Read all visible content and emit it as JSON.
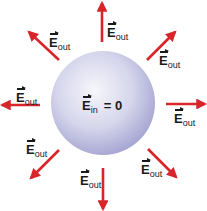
{
  "diagram": {
    "sphere": {
      "cx": 103,
      "cy": 103,
      "r": 52,
      "color_light": "#f4f4fa",
      "color_mid": "#c8c8e6",
      "color_dark": "#9f9fd0"
    },
    "center_label": {
      "symbol": "E",
      "subscript": "in",
      "equals": "= 0"
    },
    "arrow_color": "#d8252a",
    "arrows": [
      {
        "name": "top",
        "x1": 102,
        "y1": 42,
        "x2": 102,
        "y2": 3
      },
      {
        "name": "top-right",
        "x1": 147,
        "y1": 60,
        "x2": 175,
        "y2": 32
      },
      {
        "name": "right",
        "x1": 166,
        "y1": 104,
        "x2": 205,
        "y2": 104
      },
      {
        "name": "bottom-right",
        "x1": 148,
        "y1": 149,
        "x2": 176,
        "y2": 177
      },
      {
        "name": "bottom",
        "x1": 103,
        "y1": 168,
        "x2": 103,
        "y2": 209
      },
      {
        "name": "bottom-left",
        "x1": 59,
        "y1": 150,
        "x2": 31,
        "y2": 178
      },
      {
        "name": "left",
        "x1": 40,
        "y1": 105,
        "x2": 2,
        "y2": 105
      },
      {
        "name": "top-left",
        "x1": 59,
        "y1": 60,
        "x2": 29,
        "y2": 32
      }
    ],
    "field_labels": [
      {
        "name": "top",
        "symbol": "E",
        "subscript": "out",
        "x": 107,
        "y": 24
      },
      {
        "name": "top-right",
        "symbol": "E",
        "subscript": "out",
        "x": 159,
        "y": 52
      },
      {
        "name": "right",
        "symbol": "E",
        "subscript": "out",
        "x": 174,
        "y": 110
      },
      {
        "name": "bottom-right",
        "symbol": "E",
        "subscript": "out",
        "x": 141,
        "y": 161
      },
      {
        "name": "bottom",
        "symbol": "E",
        "subscript": "out",
        "x": 80,
        "y": 172
      },
      {
        "name": "bottom-left",
        "symbol": "E",
        "subscript": "out",
        "x": 26,
        "y": 141
      },
      {
        "name": "left",
        "symbol": "E",
        "subscript": "out",
        "x": 16,
        "y": 89
      },
      {
        "name": "top-left",
        "symbol": "E",
        "subscript": "out",
        "x": 49,
        "y": 34
      }
    ]
  }
}
